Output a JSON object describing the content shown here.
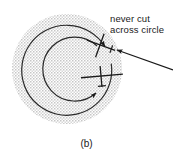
{
  "figure": {
    "caption": "(b)",
    "annotation": {
      "line1": "never cut",
      "line2": "across circle"
    },
    "colors": {
      "stipple_fill": "#d9d9d9",
      "ink": "#1a1a1a",
      "background": "#ffffff"
    },
    "elements": {
      "circle_name": "stippled-traffic-circle",
      "outer_arc_name": "outer-circular-path-arrow",
      "inner_arc_name": "inner-circular-path-arrow",
      "aircraft_upper_name": "aircraft-symbol-upper",
      "aircraft_lower_name": "aircraft-symbol-lower",
      "pointer_name": "annotation-pointer-arrow"
    },
    "geometry": {
      "circle_center_x": 67,
      "circle_center_y": 69,
      "circle_radius": 55
    }
  }
}
